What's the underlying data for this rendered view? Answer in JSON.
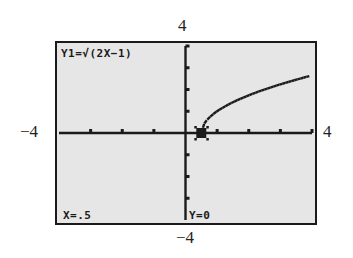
{
  "window": {
    "xmin_label": "−4",
    "xmax_label": "4",
    "ymin_label": "−4",
    "ymax_label": "4"
  },
  "screen": {
    "equation_label": "Y1=√(2X−1)",
    "trace_x_label": "X=.5",
    "trace_y_label": "Y=0",
    "background_color": "#e6e6e6",
    "ink_color": "#1a1a1a"
  },
  "chart_data": {
    "type": "line",
    "title": "Y1=√(2X−1)",
    "function": "sqrt(2x-1)",
    "xlabel": "",
    "ylabel": "",
    "xlim": [
      -4,
      4
    ],
    "ylim": [
      -4,
      4
    ],
    "xscl": 1,
    "yscl": 1,
    "grid": false,
    "axes": true,
    "series": [
      {
        "name": "Y1",
        "x": [
          0.5,
          0.6,
          0.75,
          1,
          1.25,
          1.5,
          2,
          2.5,
          3,
          3.5,
          4
        ],
        "y": [
          0,
          0.45,
          0.71,
          1,
          1.22,
          1.41,
          1.73,
          2,
          2.24,
          2.45,
          2.65
        ]
      }
    ],
    "trace_cursor": {
      "x": 0.5,
      "y": 0
    },
    "annotations": [
      "X=.5",
      "Y=0"
    ],
    "tick_labels": {
      "x": [
        "−4",
        "4"
      ],
      "y": [
        "−4",
        "4"
      ]
    }
  }
}
